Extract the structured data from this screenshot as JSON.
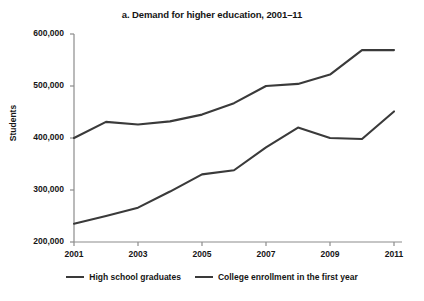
{
  "chart_data": {
    "type": "line",
    "title": "a. Demand for higher education, 2001–11",
    "xlabel": "",
    "ylabel": "Students",
    "x": [
      2001,
      2002,
      2003,
      2004,
      2005,
      2006,
      2007,
      2008,
      2009,
      2010,
      2011
    ],
    "xlim": [
      2001,
      2011
    ],
    "ylim": [
      200000,
      600000
    ],
    "ytick_labels": [
      "200,000",
      "300,000",
      "400,000",
      "500,000",
      "600,000"
    ],
    "ytick_values": [
      200000,
      300000,
      400000,
      500000,
      600000
    ],
    "xtick_labels": [
      "2001",
      "2003",
      "2005",
      "2007",
      "2009",
      "2011"
    ],
    "xtick_values": [
      2001,
      2003,
      2005,
      2007,
      2009,
      2011
    ],
    "grid": false,
    "legend_position": "bottom",
    "series": [
      {
        "name": "High school graduates",
        "color": "#3a3a3a",
        "values": [
          400000,
          431000,
          426000,
          432000,
          445000,
          467000,
          500000,
          504000,
          522000,
          569000,
          569000
        ]
      },
      {
        "name": "College enrollment in the first year",
        "color": "#3a3a3a",
        "values": [
          235000,
          250000,
          266000,
          297000,
          330000,
          338000,
          382000,
          420000,
          400000,
          398000,
          451000
        ]
      }
    ]
  }
}
